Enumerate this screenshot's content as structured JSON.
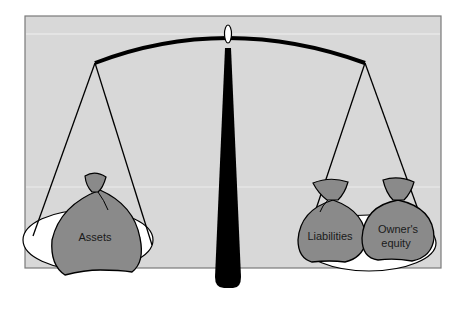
{
  "diagram": {
    "type": "balance-scale",
    "colors": {
      "background": "#d8d8d8",
      "frame_border": "#7a7a7a",
      "bag_fill": "#8a8a8a",
      "pan_fill": "#ffffff",
      "ink": "#000000"
    },
    "left_pan": {
      "bags": [
        {
          "label": "Assets"
        }
      ]
    },
    "right_pan": {
      "bags": [
        {
          "label": "Liabilities"
        },
        {
          "label_line1": "Owner's",
          "label_line2": "equity"
        }
      ]
    }
  }
}
